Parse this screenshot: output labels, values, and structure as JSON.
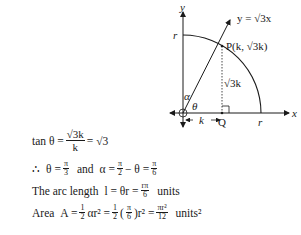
{
  "diagram": {
    "axis_x_label": "x",
    "axis_y_label": "y",
    "line_label": "y = √3x",
    "point_label": "P(k, √3k)",
    "radius_label_top": "r",
    "radius_label_right": "r",
    "foot_label": "Q",
    "segment_horizontal_label": "k",
    "segment_vertical_label": "√3k",
    "angle_theta": "θ",
    "angle_alpha": "α",
    "geometry": {
      "origin": [
        183,
        113
      ],
      "radius_px": 78,
      "point_P": [
        222,
        46
      ],
      "point_Q": [
        222,
        113
      ]
    }
  },
  "solution": {
    "line1": {
      "lhs": "tan θ =",
      "num": "√3k",
      "den": "k",
      "rhs": "= √3"
    },
    "line2": {
      "therefore": "∴",
      "theta": "θ =",
      "theta_num": "π",
      "theta_den": "3",
      "and": "and",
      "alpha": "α =",
      "a_num1": "π",
      "a_den1": "2",
      "minus": "− θ =",
      "a_num2": "π",
      "a_den2": "6"
    },
    "line3": {
      "text": "The arc length",
      "eq": "l = θr =",
      "num": "rπ",
      "den": "6",
      "units": "units"
    },
    "line4": {
      "text": "Area",
      "eq": "A =",
      "h_num": "1",
      "h_den": "2",
      "ar": "αr² =",
      "h_num2": "1",
      "h_den2": "2",
      "paren_num": "π",
      "paren_den": "6",
      "r2": "r² =",
      "res_num": "πr²",
      "res_den": "12",
      "units": "units²"
    }
  }
}
